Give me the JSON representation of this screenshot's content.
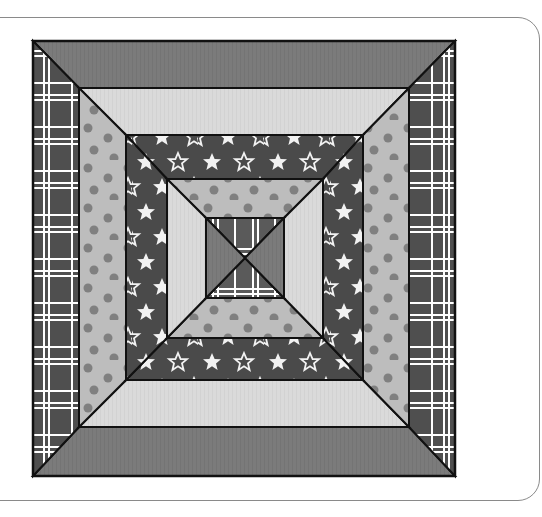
{
  "figure": {
    "type": "square-in-a-square log cabin style quilt block",
    "rings": [
      {
        "name": "outer",
        "top_bottom": "solid-medium",
        "left_right": "plaid"
      },
      {
        "name": "ring-2",
        "top_bottom": "solid-light",
        "left_right": "polka-dot"
      },
      {
        "name": "ring-3",
        "top_bottom": "stars",
        "left_right": "stars"
      },
      {
        "name": "ring-4",
        "top_bottom": "polka-dot",
        "left_right": "solid-light"
      },
      {
        "name": "center",
        "top_bottom": "plaid",
        "left_right": "solid-medium"
      }
    ]
  },
  "colors": {
    "solid_medium": "#7b7b7b",
    "solid_light": "#dadada",
    "polka_bg": "#bdbdbd",
    "polka_dot": "#808080",
    "plaid_bg": "#4f4f4f",
    "plaid_line": "#ffffff",
    "stars_bg": "#4a4a4a",
    "star": "#f2f2f2",
    "seam": "#111111",
    "frame": "#8a8a8a"
  }
}
